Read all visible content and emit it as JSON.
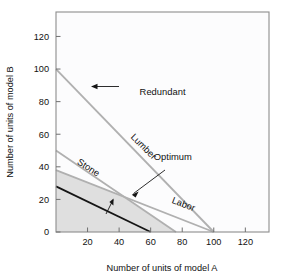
{
  "chart_data": {
    "type": "line",
    "title": "",
    "xlabel": "Number of units of model A",
    "ylabel": "Number of units of model B",
    "xlim": [
      0,
      135
    ],
    "ylim": [
      0,
      135
    ],
    "xticks": [
      20,
      40,
      60,
      80,
      100,
      120
    ],
    "yticks": [
      0,
      20,
      40,
      60,
      80,
      100,
      120
    ],
    "xtick_labels": [
      "20",
      "40",
      "60",
      "80",
      "100",
      "120"
    ],
    "ytick_labels": [
      "0",
      "20",
      "40",
      "60",
      "80",
      "100",
      "120"
    ],
    "grid": false,
    "legend": "none",
    "series": [
      {
        "name": "Lumber",
        "style": "gray-constraint",
        "points": [
          [
            0,
            100
          ],
          [
            100,
            0
          ]
        ],
        "note": "redundant constraint"
      },
      {
        "name": "Stone",
        "style": "gray-constraint",
        "points": [
          [
            0,
            50
          ],
          [
            76,
            0
          ]
        ]
      },
      {
        "name": "Labor",
        "style": "gray-constraint",
        "points": [
          [
            0,
            38
          ],
          [
            100,
            0
          ]
        ]
      },
      {
        "name": "Objective function",
        "style": "black-line",
        "points": [
          [
            0,
            28
          ],
          [
            60,
            0
          ]
        ]
      }
    ],
    "feasible_region": {
      "label": "shaded feasible region",
      "fill_color": "#dcdcdc",
      "vertices": [
        [
          0,
          0
        ],
        [
          0,
          38
        ],
        [
          41,
          22.5
        ],
        [
          76,
          0
        ]
      ]
    },
    "optimum_point": [
      41,
      22.5
    ],
    "annotations": [
      {
        "name": "redundant",
        "text": "Redundant",
        "x": 53,
        "y": 84,
        "rotation": 0,
        "arrow": "left"
      },
      {
        "name": "lumber",
        "text": "Lumber",
        "x": 47,
        "y": 58,
        "rotation": 45,
        "arrow": "none"
      },
      {
        "name": "stone",
        "text": "Stone",
        "x": 13,
        "y": 42,
        "rotation": 33,
        "arrow": "none"
      },
      {
        "name": "optimum",
        "text": "Optimum",
        "x": 62,
        "y": 44,
        "rotation": 0,
        "arrow": "down-left"
      },
      {
        "name": "labor",
        "text": "Labor",
        "x": 73,
        "y": 18,
        "rotation": 21,
        "arrow": "none"
      },
      {
        "name": "improve-direction",
        "text": "",
        "x": 35,
        "y": 16,
        "rotation": 0,
        "arrow": "up"
      }
    ],
    "colors": {
      "constraint_line": "#b0b0b0",
      "objective_line": "#151515",
      "feasible_fill": "#dcdcdc",
      "plot_background": "#fcfcfd",
      "frame": "#8d8d8d",
      "text": "#111111"
    }
  }
}
